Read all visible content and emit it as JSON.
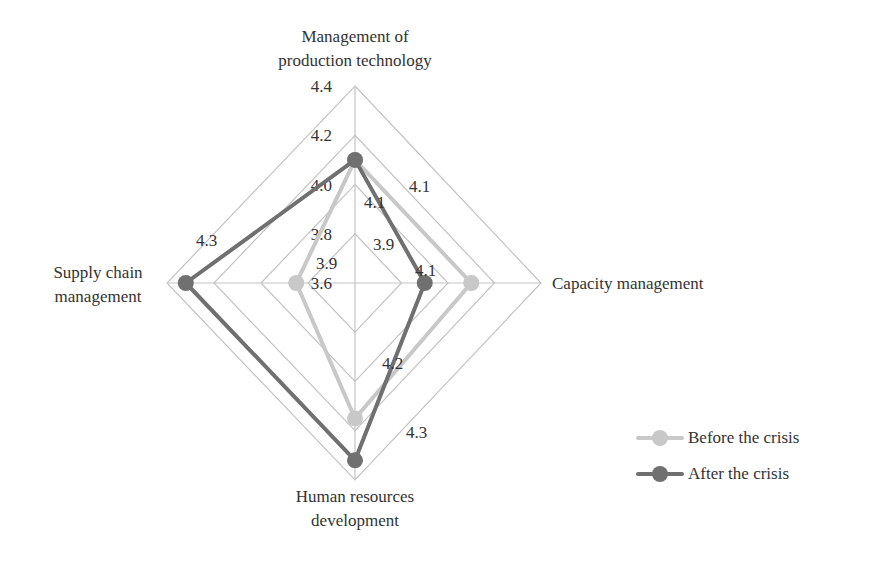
{
  "chart_data": {
    "type": "radar",
    "title": "",
    "axes": [
      "Management of production technology",
      "Capacity management",
      "Human resources development",
      "Supply chain management"
    ],
    "axis_label_lines": [
      [
        "Management of",
        "production technology"
      ],
      [
        "Capacity management"
      ],
      [
        "Human resources",
        "development"
      ],
      [
        "Supply chain",
        "management"
      ]
    ],
    "scale": {
      "min": 3.6,
      "max": 4.4,
      "step": 0.2
    },
    "tick_labels": [
      "3.6",
      "3.8",
      "4.0",
      "4.2",
      "4.4"
    ],
    "series": [
      {
        "name": "Before the crisis",
        "color": "#c8c8c8",
        "values": [
          4.1,
          4.1,
          4.15,
          3.85
        ],
        "data_labels": [
          "4.1",
          "4.1",
          "4.2",
          "3.9"
        ]
      },
      {
        "name": "After the crisis",
        "color": "#707070",
        "values": [
          4.1,
          3.9,
          4.32,
          4.32
        ],
        "data_labels": [
          "4.1",
          "3.9",
          "4.3",
          "4.3"
        ]
      }
    ],
    "legend_position": "right-bottom",
    "grid": true
  },
  "legend": {
    "items": [
      {
        "label": "Before the crisis",
        "color": "#c8c8c8"
      },
      {
        "label": "After the crisis",
        "color": "#707070"
      }
    ]
  }
}
